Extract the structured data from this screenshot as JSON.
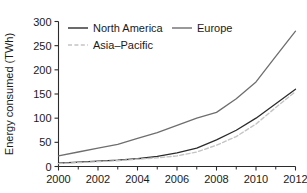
{
  "chart_data": {
    "type": "line",
    "title": "",
    "xlabel": "",
    "ylabel": "Energy consumed (TWh)",
    "xlim": [
      2000,
      2012
    ],
    "ylim": [
      0,
      300
    ],
    "grid": false,
    "legend_position": "upper left inside",
    "x": [
      2000,
      2001,
      2002,
      2003,
      2004,
      2005,
      2006,
      2007,
      2008,
      2009,
      2010,
      2011,
      2012
    ],
    "xticks": [
      2000,
      2002,
      2004,
      2006,
      2008,
      2010,
      2012
    ],
    "xtick_labels": [
      "2000",
      "2002",
      "2004",
      "2006",
      "2008",
      "2010",
      "2012"
    ],
    "xminor_ticks": [
      2001,
      2003,
      2005,
      2007,
      2009,
      2011
    ],
    "yticks": [
      0,
      50,
      100,
      150,
      200,
      250,
      300
    ],
    "ytick_labels": [
      "0",
      "50",
      "100",
      "150",
      "200",
      "250",
      "300"
    ],
    "series": [
      {
        "name": "North America",
        "color": "#2b2b2b",
        "style": "solid",
        "values": [
          7,
          9,
          11,
          13,
          16,
          21,
          28,
          38,
          55,
          75,
          100,
          130,
          160
        ]
      },
      {
        "name": "Europe",
        "color": "#6e6e6e",
        "style": "solid",
        "values": [
          22,
          30,
          38,
          46,
          58,
          70,
          85,
          100,
          112,
          140,
          175,
          228,
          280
        ]
      },
      {
        "name": "Asia-Pacific",
        "color": "#c4c4c4",
        "style": "dashed",
        "values": [
          6,
          8,
          10,
          12,
          15,
          18,
          22,
          30,
          44,
          62,
          88,
          122,
          155
        ]
      }
    ]
  },
  "legend": {
    "entries": [
      {
        "label": "North America"
      },
      {
        "label": "Europe"
      },
      {
        "label": "Asia–Pacific"
      }
    ]
  }
}
